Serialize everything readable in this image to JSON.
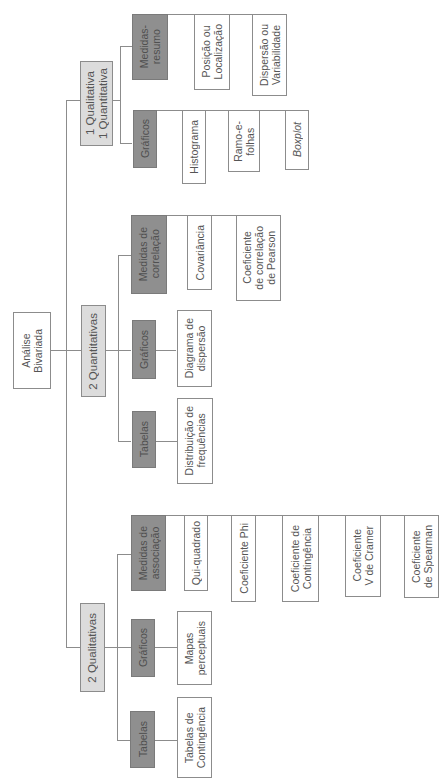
{
  "diagram": {
    "orientation": "rotated-90-ccw",
    "colors": {
      "root_fill": "#ffffff",
      "category_fill": "#dcdcdc",
      "group_fill": "#8f8f8f",
      "leaf_fill": "#ffffff",
      "line": "#8c8c8c"
    },
    "root": {
      "label": "Análise\nBivariada"
    },
    "branches": [
      {
        "label": "1 Qualitativa\n1 Quantitativa",
        "groups": [
          {
            "label": "Medidas-\nresumo",
            "items": [
              "Posição ou\nLocalização",
              "Dispersão ou\nVariabilidade"
            ]
          },
          {
            "label": "Gráficos",
            "items": [
              "Histograma",
              "Ramo-e-\nfolhas",
              "Boxplot"
            ]
          }
        ]
      },
      {
        "label": "2 Quantitativas",
        "groups": [
          {
            "label": "Medidas de\ncorrelação",
            "items": [
              "Covariância",
              "Coeficiente\nde correlação\nde Pearson"
            ]
          },
          {
            "label": "Gráficos",
            "items": [
              "Diagrama de\ndispersão"
            ]
          },
          {
            "label": "Tabelas",
            "items": [
              "Distribuição de\nfrequências"
            ]
          }
        ]
      },
      {
        "label": "2 Qualitativas",
        "groups": [
          {
            "label": "Medidas de\nassociação",
            "items": [
              "Qui-quadrado",
              "Coeficiente Phi",
              "Coeficiente de\nContingência",
              "Coeficiente\nV de Cramer",
              "Coeficiente\nde Spearman"
            ]
          },
          {
            "label": "Gráficos",
            "items": [
              "Mapas\nperceptuais"
            ]
          },
          {
            "label": "Tabelas",
            "items": [
              "Tabelas de\nContingência"
            ]
          }
        ]
      }
    ]
  }
}
